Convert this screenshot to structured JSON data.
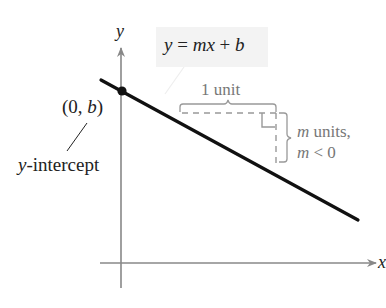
{
  "equation": {
    "y": "y",
    "equals": " = ",
    "m": "m",
    "x": "x",
    "plus": " + ",
    "b": "b"
  },
  "axes": {
    "x_label": "x",
    "y_label": "y"
  },
  "intercept": {
    "coord_open": "(0, ",
    "coord_b": "b",
    "coord_close": ")",
    "label_y": "y",
    "label_rest": "-intercept"
  },
  "slope_triangle": {
    "run_label": "1 unit",
    "rise_label_m": "m",
    "rise_label_rest": " units,",
    "condition_m": "m",
    "condition_rest": " < 0"
  },
  "colors": {
    "line": "#111111",
    "axis": "#888888",
    "annotation": "#999999",
    "equation_bg": "#f3f3f3"
  }
}
